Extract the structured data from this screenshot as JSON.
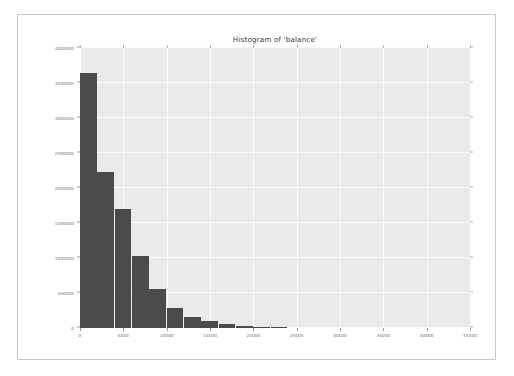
{
  "figure": {
    "background_color": "#ffffff",
    "border_color": "#c9c9c9",
    "plot_background_color": "#eaeaea",
    "gridline_color": "#fbfbfb",
    "bar_color": "#4b4b4b",
    "tick_label_color": "#6b6b6b",
    "title_color": "#3d3d3d"
  },
  "chart_data": {
    "type": "bar",
    "title": "Histogram of 'balance'",
    "xlabel": "",
    "ylabel": "",
    "xlim": [
      0,
      45000
    ],
    "ylim": [
      0,
      4000000
    ],
    "grid": true,
    "legend": false,
    "legend_position": "none",
    "bin_width": 2000,
    "xticks": [
      0,
      5000,
      10000,
      15000,
      20000,
      25000,
      30000,
      35000,
      40000,
      45000
    ],
    "xtick_labels": [
      "0",
      "5000",
      "10000",
      "15000",
      "20000",
      "25000",
      "30000",
      "35000",
      "40000",
      "45000"
    ],
    "yticks": [
      0,
      500000,
      1000000,
      1500000,
      2000000,
      2500000,
      3000000,
      3500000,
      4000000
    ],
    "ytick_labels": [
      "0",
      "500000",
      "1000000",
      "1500000",
      "2000000",
      "2500000",
      "3000000",
      "3500000",
      "4000000"
    ],
    "bins": [
      {
        "x0": 0,
        "x1": 2000,
        "value": 3640000
      },
      {
        "x0": 2000,
        "x1": 4000,
        "value": 2230000
      },
      {
        "x0": 4000,
        "x1": 6000,
        "value": 1700000
      },
      {
        "x0": 6000,
        "x1": 8000,
        "value": 1030000
      },
      {
        "x0": 8000,
        "x1": 10000,
        "value": 557000
      },
      {
        "x0": 10000,
        "x1": 12000,
        "value": 286000
      },
      {
        "x0": 12000,
        "x1": 14000,
        "value": 157000
      },
      {
        "x0": 14000,
        "x1": 16000,
        "value": 100000
      },
      {
        "x0": 16000,
        "x1": 18000,
        "value": 57000
      },
      {
        "x0": 18000,
        "x1": 20000,
        "value": 29000
      },
      {
        "x0": 20000,
        "x1": 22000,
        "value": 14000
      },
      {
        "x0": 22000,
        "x1": 24000,
        "value": 6000
      }
    ],
    "categories": [
      "0-2000",
      "2000-4000",
      "4000-6000",
      "6000-8000",
      "8000-10000",
      "10000-12000",
      "12000-14000",
      "14000-16000",
      "16000-18000",
      "18000-20000",
      "20000-22000",
      "22000-24000"
    ],
    "values": [
      3640000,
      2230000,
      1700000,
      1030000,
      557000,
      286000,
      157000,
      100000,
      57000,
      29000,
      14000,
      6000
    ]
  }
}
